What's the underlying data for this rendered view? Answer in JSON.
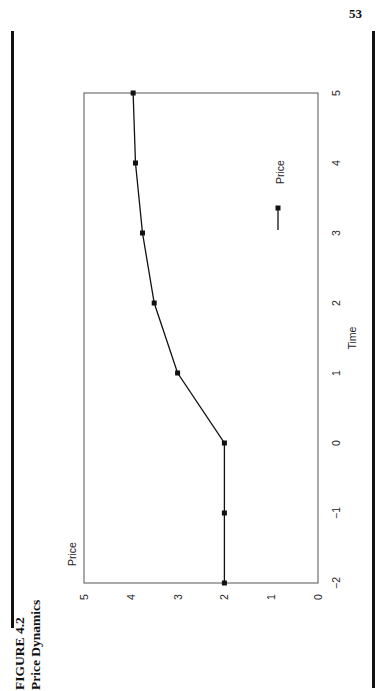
{
  "page": {
    "number": "53"
  },
  "figure": {
    "label": "FIGURE 4.2",
    "title": "Price Dynamics"
  },
  "chart_data": {
    "type": "line",
    "orientation": "rotated 90° counter-clockwise on page",
    "title": "Price Dynamics",
    "xlabel": "Time",
    "ylabel": "Price",
    "x": [
      -2,
      -1,
      0,
      1,
      2,
      3,
      4,
      5
    ],
    "series": [
      {
        "name": "Price",
        "marker": "square",
        "color": "#111111",
        "values": [
          2.0,
          2.0,
          2.0,
          3.0,
          3.5,
          3.75,
          3.9,
          3.95
        ]
      }
    ],
    "xlim": [
      -2,
      5
    ],
    "ylim": [
      0,
      5
    ],
    "x_ticks": [
      "−2",
      "−1",
      "0",
      "1",
      "2",
      "3",
      "4",
      "5"
    ],
    "y_ticks": [
      "0",
      "1",
      "2",
      "3",
      "4",
      "5"
    ],
    "grid": false,
    "legend": {
      "position": "right-middle",
      "entries": [
        "Price"
      ]
    }
  }
}
